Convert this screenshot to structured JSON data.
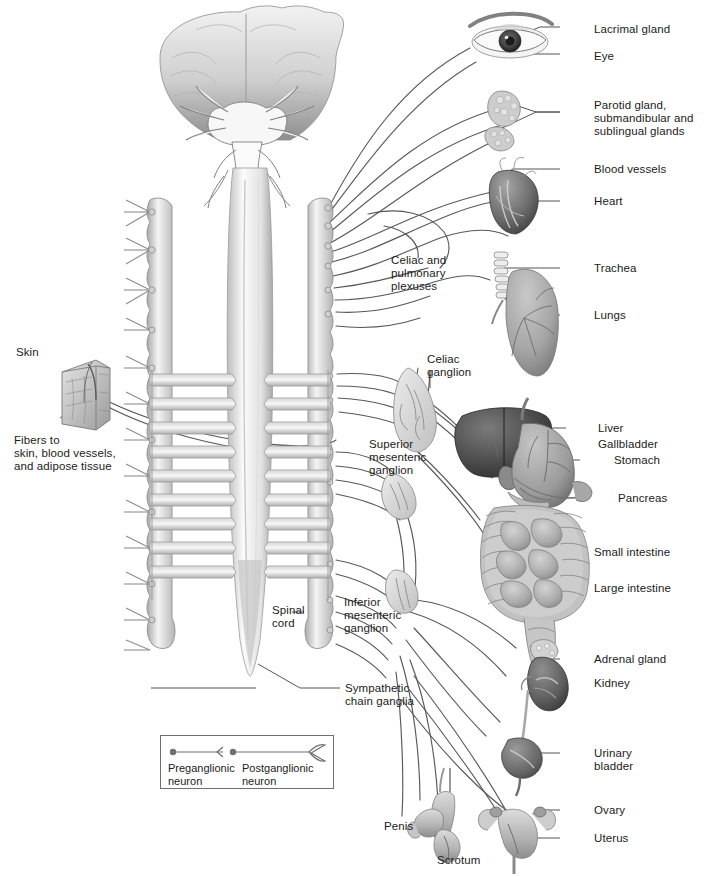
{
  "figure": {
    "type": "anatomical-diagram",
    "background_color": "#ffffff",
    "label_color": "#1b1b1b",
    "leader_line_color": "#4a4a4a"
  },
  "right_labels": [
    {
      "id": "lacrimal-gland",
      "text": "Lacrimal gland",
      "x": 594,
      "y": 23
    },
    {
      "id": "eye",
      "text": "Eye",
      "x": 594,
      "y": 50
    },
    {
      "id": "parotid-glands",
      "text": "Parotid gland,\nsubmandibular and\nsublingual glands",
      "x": 594,
      "y": 104
    },
    {
      "id": "blood-vessels",
      "text": "Blood vessels",
      "x": 594,
      "y": 165
    },
    {
      "id": "heart",
      "text": "Heart",
      "x": 594,
      "y": 197
    },
    {
      "id": "trachea",
      "text": "Trachea",
      "x": 594,
      "y": 264
    },
    {
      "id": "lungs",
      "text": "Lungs",
      "x": 594,
      "y": 311
    },
    {
      "id": "liver",
      "text": "Liver",
      "x": 598,
      "y": 424
    },
    {
      "id": "gallbladder",
      "text": "Gallbladder",
      "x": 598,
      "y": 440
    },
    {
      "id": "stomach",
      "text": "Stomach",
      "x": 612,
      "y": 456
    },
    {
      "id": "pancreas",
      "text": "Pancreas",
      "x": 616,
      "y": 494
    },
    {
      "id": "small-intestine",
      "text": "Small intestine",
      "x": 594,
      "y": 548
    },
    {
      "id": "large-intestine",
      "text": "Large intestine",
      "x": 594,
      "y": 584
    },
    {
      "id": "adrenal-gland",
      "text": "Adrenal gland",
      "x": 594,
      "y": 655
    },
    {
      "id": "kidney",
      "text": "Kidney",
      "x": 594,
      "y": 679
    },
    {
      "id": "urinary-bladder",
      "text": "Urinary\nbladder",
      "x": 594,
      "y": 749
    },
    {
      "id": "ovary",
      "text": "Ovary",
      "x": 594,
      "y": 806
    },
    {
      "id": "uterus",
      "text": "Uterus",
      "x": 594,
      "y": 834
    }
  ],
  "left_labels": [
    {
      "id": "skin",
      "text": "Skin",
      "x": 16,
      "y": 346
    },
    {
      "id": "fibers-to",
      "text": "Fibers to\nskin, blood vessels,\nand adipose tissue",
      "x": 14,
      "y": 434
    }
  ],
  "center_labels": [
    {
      "id": "celiac-pulmonary-plexuses",
      "text": "Celiac and\npulmonary\nplexuses",
      "x": 391,
      "y": 254
    },
    {
      "id": "celiac-ganglion",
      "text": "Celiac\nganglion",
      "x": 427,
      "y": 355
    },
    {
      "id": "superior-mesenteric-ganglion",
      "text": "Superior\nmesenteric\nganglion",
      "x": 369,
      "y": 440
    },
    {
      "id": "inferior-mesenteric-ganglion",
      "text": "Inferior\nmesenteric\nganglion",
      "x": 344,
      "y": 598
    },
    {
      "id": "spinal-cord",
      "text": "Spinal\ncord",
      "x": 272,
      "y": 605
    },
    {
      "id": "sympathetic-chain-ganglia",
      "text": "Sympathetic\nchain ganglia",
      "x": 345,
      "y": 684
    }
  ],
  "bottom_labels": [
    {
      "id": "penis",
      "text": "Penis",
      "x": 384,
      "y": 821
    },
    {
      "id": "scrotum",
      "text": "Scrotum",
      "x": 437,
      "y": 856
    }
  ],
  "legend": {
    "box": {
      "x": 160,
      "y": 735,
      "width": 172,
      "height": 52
    },
    "items": [
      {
        "id": "preganglionic-neuron",
        "label": "Preganglionic\nneuron",
        "symbol": "neuron-soma-axon"
      },
      {
        "id": "postganglionic-neuron",
        "label": "Postganglionic\nneuron",
        "symbol": "neuron-soma-axon-branched"
      }
    ]
  }
}
